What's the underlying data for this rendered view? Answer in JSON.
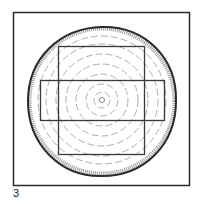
{
  "figure": {
    "label": "3",
    "colors": {
      "frame": "#2a2a2a",
      "bark": "#2a2a2a",
      "bark_texture": "#9a9a9a",
      "rings": "#b0b0b0",
      "cuts": "#3a3a3a",
      "background": "#ffffff"
    },
    "frame": {
      "x": 13,
      "y": 12,
      "w": 176,
      "h": 173
    },
    "log": {
      "cx": 102,
      "cy": 101,
      "r": 74
    },
    "rings": [
      6,
      16,
      26,
      36,
      46,
      56,
      64
    ],
    "vertical_cut": {
      "x": 58,
      "y": 46,
      "w": 86,
      "h": 108
    },
    "horizontal_cut": {
      "x": 40,
      "y": 80,
      "w": 124,
      "h": 40
    }
  }
}
